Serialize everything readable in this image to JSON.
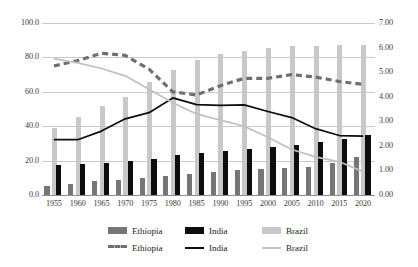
{
  "chart_data": {
    "type": "bar",
    "title": "",
    "subtitle": "",
    "xlabel": "",
    "ylabel": "",
    "categories": [
      "1955",
      "1960",
      "1965",
      "1970",
      "1975",
      "1980",
      "1985",
      "1990",
      "1995",
      "2000",
      "2005",
      "2010",
      "2015",
      "2020"
    ],
    "left_axis": {
      "label": "",
      "ylim": [
        0.0,
        100.0
      ],
      "ticks": [
        "0.0",
        "20.0",
        "40.0",
        "60.0",
        "80.0",
        "100.0"
      ],
      "tick_values": [
        0.0,
        20.0,
        40.0,
        60.0,
        80.0,
        100.0
      ]
    },
    "right_axis": {
      "label": "",
      "ylim": [
        0.0,
        7.0
      ],
      "ticks": [
        "0.00",
        "1.00",
        "2.00",
        "3.00",
        "4.00",
        "5.00",
        "6.00",
        "7.00"
      ],
      "tick_values": [
        0.0,
        1.0,
        2.0,
        3.0,
        4.0,
        5.0,
        6.0,
        7.0
      ]
    },
    "grid": true,
    "legend_position": "bottom",
    "bar_series": [
      {
        "name": "Ethiopia",
        "axis": "left",
        "color": "#767676",
        "values": [
          5.5,
          6.5,
          8.0,
          9.0,
          10.0,
          11.0,
          12.5,
          13.5,
          14.5,
          15.0,
          15.5,
          16.5,
          18.5,
          22.0
        ]
      },
      {
        "name": "India",
        "axis": "left",
        "color": "#0d0d0d",
        "values": [
          17.5,
          18.0,
          18.8,
          19.8,
          21.0,
          23.2,
          24.3,
          25.5,
          26.8,
          27.7,
          29.0,
          30.9,
          32.8,
          34.9
        ]
      },
      {
        "name": "Brazil",
        "axis": "left",
        "color": "#c8c8c8",
        "values": [
          39.0,
          45.5,
          51.5,
          57.0,
          65.5,
          72.5,
          78.5,
          82.0,
          84.0,
          85.5,
          86.5,
          86.5,
          87.0,
          87.5
        ]
      }
    ],
    "line_series": [
      {
        "name": "Ethiopia",
        "axis": "right",
        "color": "#6f6f6f",
        "style": "dashed",
        "values": [
          5.25,
          5.47,
          5.77,
          5.68,
          5.12,
          4.2,
          4.07,
          4.45,
          4.75,
          4.75,
          4.9,
          4.8,
          4.62,
          4.5
        ]
      },
      {
        "name": "India",
        "axis": "right",
        "color": "#0d0d0d",
        "style": "solid",
        "values": [
          2.25,
          2.25,
          2.6,
          3.1,
          3.35,
          3.95,
          3.68,
          3.65,
          3.67,
          3.4,
          3.15,
          2.7,
          2.42,
          2.4
        ]
      },
      {
        "name": "Brazil",
        "axis": "right",
        "color": "#c0c0c0",
        "style": "solid",
        "values": [
          5.55,
          5.38,
          5.15,
          4.85,
          4.3,
          3.75,
          3.3,
          3.05,
          2.8,
          2.35,
          1.85,
          1.55,
          1.35,
          0.95
        ]
      }
    ]
  },
  "legend": {
    "rows": [
      {
        "kind": "bar",
        "items": [
          {
            "label": "Ethiopia",
            "color": "#767676"
          },
          {
            "label": "India",
            "color": "#0d0d0d"
          },
          {
            "label": "Brazil",
            "color": "#c8c8c8"
          }
        ]
      },
      {
        "kind": "line",
        "items": [
          {
            "label": "Ethiopia",
            "color": "#6f6f6f",
            "style": "dashed"
          },
          {
            "label": "India",
            "color": "#0d0d0d",
            "style": "solid"
          },
          {
            "label": "Brazil",
            "color": "#c0c0c0",
            "style": "solid"
          }
        ]
      }
    ]
  }
}
